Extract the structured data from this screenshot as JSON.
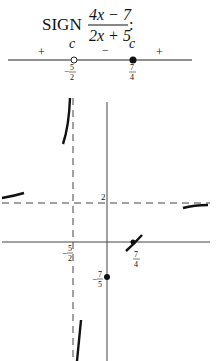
{
  "title": {
    "prefix": "SIGN",
    "numerator": "4x − 7",
    "denominator": "2x + 5",
    "suffix": ":"
  },
  "sign_chart": {
    "signs": [
      "+",
      "−",
      "+"
    ],
    "critical_points": [
      {
        "label_num": "5",
        "label_den": "2",
        "neg": true,
        "marker": "open",
        "tag": "c"
      },
      {
        "label_num": "7",
        "label_den": "4",
        "neg": false,
        "marker": "filled",
        "tag": "c"
      }
    ]
  },
  "graph": {
    "function": "(4x-7)/(2x+5)",
    "vertical_asymptote": {
      "x": -2.5,
      "label_num": "5",
      "label_den": "2",
      "neg": true
    },
    "horizontal_asymptote": {
      "y": 2,
      "label": "2"
    },
    "x_intercept": {
      "x": 1.75,
      "label_num": "7",
      "label_den": "4"
    },
    "y_intercept": {
      "y": -1.4,
      "label_num": "7",
      "label_den": "5",
      "neg": true
    }
  }
}
